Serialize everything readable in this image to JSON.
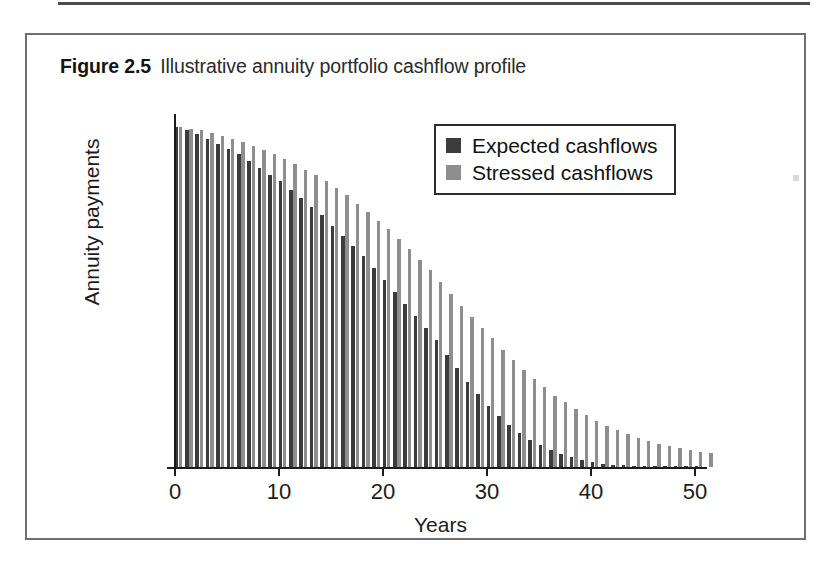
{
  "figure": {
    "number": "Figure 2.5",
    "title": "Illustrative annuity portfolio cashflow profile"
  },
  "chart_data": {
    "type": "bar",
    "title": "Illustrative annuity portfolio cashflow profile",
    "xlabel": "Years",
    "ylabel": "Annuity payments",
    "xlim": [
      -0.5,
      51.5
    ],
    "ylim": [
      0,
      100
    ],
    "grid": false,
    "legend_position": "top-right",
    "x_tick_labels": [
      "0",
      "10",
      "20",
      "30",
      "40",
      "50"
    ],
    "x_tick_values": [
      0,
      10,
      20,
      30,
      40,
      50
    ],
    "y_tick_labels": [],
    "categories": [
      0,
      1,
      2,
      3,
      4,
      5,
      6,
      7,
      8,
      9,
      10,
      11,
      12,
      13,
      14,
      15,
      16,
      17,
      18,
      19,
      20,
      21,
      22,
      23,
      24,
      25,
      26,
      27,
      28,
      29,
      30,
      31,
      32,
      33,
      34,
      35,
      36,
      37,
      38,
      39,
      40,
      41,
      42,
      43,
      44,
      45,
      46,
      47,
      48,
      49,
      50,
      51
    ],
    "series": [
      {
        "name": "Expected cashflows",
        "color": "#3c3c3c",
        "values": [
          100,
          99,
          98,
          96.5,
          95,
          93.5,
          92,
          90,
          88,
          86,
          84,
          81.5,
          79,
          76.5,
          74,
          71,
          68,
          65,
          62,
          58.5,
          55,
          51.5,
          48,
          44.5,
          41,
          37.5,
          33,
          29,
          25,
          21.5,
          18,
          15,
          12.5,
          10,
          8,
          6.5,
          5,
          3.8,
          2.8,
          2,
          1.4,
          1,
          0.7,
          0.5,
          0.3,
          0.2,
          0.15,
          0.1,
          0.06,
          0.04,
          0.02,
          0
        ]
      },
      {
        "name": "Stressed cashflows",
        "color": "#8e8e8e",
        "values": [
          100,
          99.5,
          99,
          98.3,
          97.5,
          96.5,
          95.5,
          94.5,
          93.3,
          92,
          90.5,
          89,
          87.5,
          86,
          84,
          82,
          80,
          77.5,
          75,
          72.5,
          70,
          67,
          64,
          61,
          58,
          54.5,
          51,
          47.5,
          44,
          41,
          38,
          34.5,
          31.5,
          28.5,
          26,
          23.5,
          21,
          19,
          17,
          15.2,
          13.5,
          12,
          10.8,
          9.6,
          8.6,
          7.7,
          6.9,
          6.2,
          5.6,
          5.0,
          4.5,
          4.0
        ]
      }
    ]
  },
  "legend": {
    "items": [
      {
        "label": "Expected cashflows",
        "color": "#3c3c3c"
      },
      {
        "label": "Stressed cashflows",
        "color": "#8e8e8e"
      }
    ]
  },
  "axes": {
    "x_title": "Years",
    "y_title": "Annuity payments"
  }
}
